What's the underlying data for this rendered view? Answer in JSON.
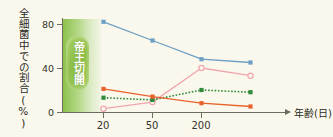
{
  "chart_data": {
    "type": "line",
    "title": "",
    "xlabel": "年齢(日)",
    "ylabel": "全細菌中での割合(%)",
    "categories": [
      "20",
      "50",
      "200",
      ""
    ],
    "xtick_labels": [
      "20",
      "50",
      "200"
    ],
    "ytick_labels": [
      "0",
      "40",
      "80"
    ],
    "ylim": [
      0,
      90
    ],
    "yticks": [
      0,
      40,
      80
    ],
    "grid": false,
    "legend_position": "none",
    "annotation": {
      "text": "帝王切開",
      "orientation": "vertical",
      "region": "left",
      "color": "#8dbf46"
    },
    "series": [
      {
        "name": "blue-series",
        "color": "#6d9fc4",
        "marker": "filled-square",
        "line_style": "solid",
        "values": [
          82,
          65,
          48,
          45
        ]
      },
      {
        "name": "pink-series",
        "color": "#f0a6ae",
        "marker": "open-circle",
        "line_style": "solid",
        "values": [
          3,
          9,
          40,
          33
        ]
      },
      {
        "name": "green-series",
        "color": "#2f8c3b",
        "marker": "filled-square",
        "line_style": "dotted",
        "values": [
          13,
          11,
          20,
          18
        ]
      },
      {
        "name": "orange-series",
        "color": "#e8622c",
        "marker": "filled-square",
        "line_style": "solid",
        "values": [
          21,
          14,
          8,
          5
        ]
      }
    ]
  },
  "colors": {
    "background": "#faf8ec",
    "axis": "#6d6c5e",
    "text": "#2b2b26",
    "blue": "#6d9fc4",
    "orange": "#e8622c",
    "green": "#2f8c3b",
    "pink": "#f0a6ae",
    "band_green": "#8dbf46"
  }
}
